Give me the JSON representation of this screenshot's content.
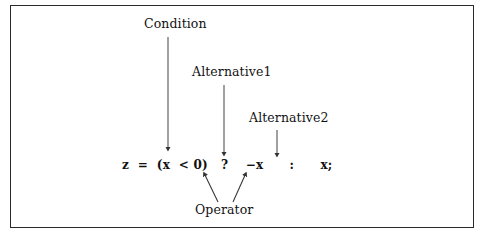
{
  "figure": {
    "background_color": "#ffffff",
    "border_color": "#2a2a2a",
    "line_color": "#333333"
  },
  "code": {
    "expression": "z  =  (x  < 0)   ?    −x      :      x;"
  },
  "labels": {
    "condition": "Condition",
    "alternative1": "Alternative1",
    "alternative2": "Alternative2",
    "operator": "Operator"
  },
  "annotations": [
    {
      "name": "condition-arrow",
      "label": "Condition",
      "points_to": "(x < 0)",
      "direction": "down"
    },
    {
      "name": "alternative1-arrow",
      "label": "Alternative1",
      "points_to": "−x",
      "direction": "down"
    },
    {
      "name": "alternative2-arrow",
      "label": "Alternative2",
      "points_to": "x;",
      "direction": "down"
    },
    {
      "name": "operator-arrow-left",
      "label": "Operator",
      "points_to": "?",
      "direction": "up-left"
    },
    {
      "name": "operator-arrow-right",
      "label": "Operator",
      "points_to": ":",
      "direction": "up-right"
    }
  ]
}
